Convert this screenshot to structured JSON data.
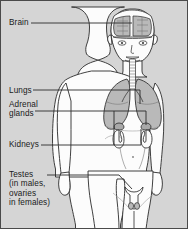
{
  "figure": {
    "background_color": "#d5d5d5",
    "border_color": "#4a4a4a",
    "line_color": "#2b2b2b",
    "body_fill": "#fcfcfc",
    "organ_shade": "#b9b9b9",
    "organ_shade_dark": "#a8a8a8"
  },
  "labels": {
    "brain": "Brain",
    "lungs": "Lungs",
    "adrenal_line1": "Adrenal",
    "adrenal_line2": "glands",
    "kidneys": "Kidneys",
    "testes_line1": "Testes",
    "testes_line2": "(in males,",
    "testes_line3": "ovaries",
    "testes_line4": "in females)"
  },
  "organs": [
    {
      "name": "brain",
      "label": "Brain"
    },
    {
      "name": "lungs",
      "label": "Lungs"
    },
    {
      "name": "adrenal-glands",
      "label": "Adrenal glands"
    },
    {
      "name": "kidneys",
      "label": "Kidneys"
    },
    {
      "name": "testes-ovaries",
      "label": "Testes (in males, ovaries in females)"
    }
  ]
}
